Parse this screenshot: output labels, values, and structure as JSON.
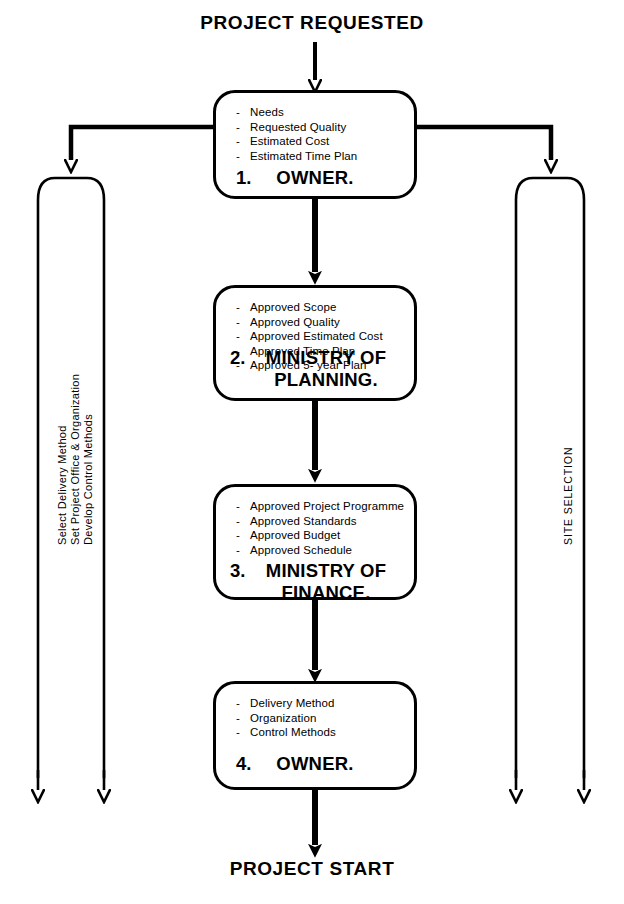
{
  "diagram": {
    "title_top": "PROJECT REQUESTED",
    "title_bottom": "PROJECT START",
    "stroke_color": "#000000",
    "background_color": "#ffffff",
    "nodes": [
      {
        "number": "1.",
        "name": "OWNER.",
        "name_line2": "",
        "bullets": [
          "Needs",
          "Requested Quality",
          "Estimated Cost",
          "Estimated Time Plan"
        ]
      },
      {
        "number": "2.",
        "name": "MINISTRY OF",
        "name_line2": "PLANNING.",
        "bullets": [
          "Approved Scope",
          "Approved Quality",
          "Approved Estimated Cost",
          "Approved Time Plan",
          "Approved 5- year Plan"
        ]
      },
      {
        "number": "3.",
        "name": "MINISTRY OF",
        "name_line2": "FINANCE.",
        "bullets": [
          "Approved Project Programme",
          "Approved Standards",
          "Approved Budget",
          "Approved Schedule"
        ]
      },
      {
        "number": "4.",
        "name": "OWNER.",
        "name_line2": "",
        "bullets": [
          "Delivery Method",
          "Organization",
          "Control Methods"
        ]
      }
    ],
    "side_labels": {
      "left": [
        "Select Delivery Method",
        "Set Project Office & Organization",
        "Develop Control Methods"
      ],
      "right": [
        "SITE SELECTION"
      ]
    },
    "bullet_marker": "-"
  }
}
